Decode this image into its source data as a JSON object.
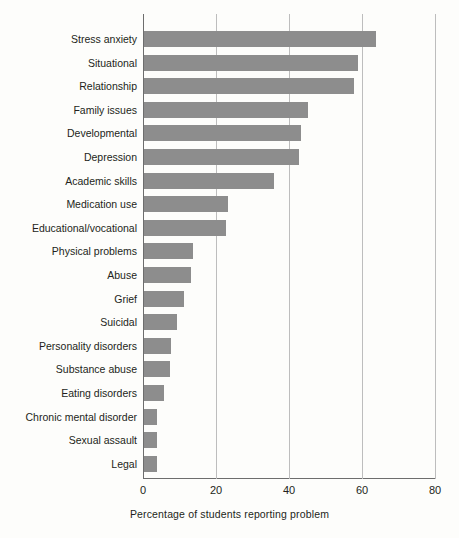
{
  "chart_data": {
    "type": "bar",
    "orientation": "horizontal",
    "title": "",
    "xlabel": "Percentage of students reporting problem",
    "ylabel": "",
    "xlim": [
      0,
      80
    ],
    "xticks": [
      0,
      20,
      40,
      60,
      80
    ],
    "xtick_labels": [
      "0",
      "20",
      "40",
      "60",
      "80"
    ],
    "grid": "vertical",
    "legend": "none",
    "bar_color": "#8d8d8d",
    "categories": [
      "Stress anxiety",
      "Situational",
      "Relationship",
      "Family issues",
      "Developmental",
      "Depression",
      "Academic skills",
      "Medication use",
      "Educational/vocational",
      "Physical problems",
      "Abuse",
      "Grief",
      "Suicidal",
      "Personality disorders",
      "Substance abuse",
      "Eating disorders",
      "Chronic mental disorder",
      "Sexual assault",
      "Legal"
    ],
    "values": [
      63.5,
      58.5,
      57.5,
      45,
      43,
      42.5,
      35.5,
      23,
      22.5,
      13.5,
      13,
      11,
      9,
      7.5,
      7,
      5.5,
      3.5,
      3.5,
      3.5
    ]
  }
}
